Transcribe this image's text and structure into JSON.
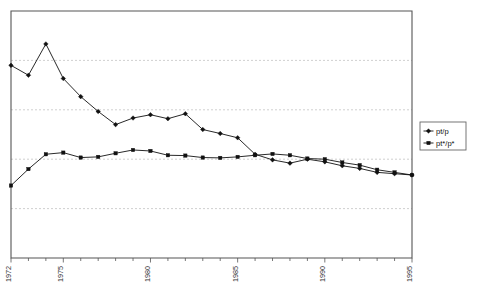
{
  "chart_data": {
    "type": "line",
    "title": "",
    "subtitle": "",
    "xlabel": "",
    "ylabel": "",
    "grid": true,
    "gridlines_y": [
      0.9,
      0.75,
      0.6,
      0.45
    ],
    "xlim": [
      1972,
      1995
    ],
    "ylim": [
      0.3,
      1.05
    ],
    "legend_position": "right",
    "x": [
      1972,
      1973,
      1974,
      1975,
      1976,
      1977,
      1978,
      1979,
      1980,
      1981,
      1982,
      1983,
      1984,
      1985,
      1986,
      1987,
      1988,
      1989,
      1990,
      1991,
      1992,
      1993,
      1994,
      1995
    ],
    "xtick_labels": [
      "1972",
      "1975",
      "1980",
      "1985",
      "1990",
      "1995"
    ],
    "xtick_values": [
      1972,
      1975,
      1980,
      1985,
      1990,
      1995
    ],
    "series": [
      {
        "name": "pt/p",
        "marker": "diamond",
        "color": "#111111",
        "values": [
          0.885,
          0.855,
          0.95,
          0.845,
          0.79,
          0.745,
          0.705,
          0.725,
          0.735,
          0.723,
          0.738,
          0.69,
          0.678,
          0.665,
          0.615,
          0.598,
          0.588,
          0.6,
          0.592,
          0.58,
          0.572,
          0.56,
          0.556,
          0.552
        ]
      },
      {
        "name": "pt*/p*",
        "marker": "square",
        "color": "#111111",
        "values": [
          0.52,
          0.57,
          0.615,
          0.62,
          0.605,
          0.607,
          0.618,
          0.628,
          0.625,
          0.612,
          0.611,
          0.605,
          0.604,
          0.607,
          0.612,
          0.616,
          0.612,
          0.602,
          0.6,
          0.59,
          0.582,
          0.568,
          0.56,
          0.552
        ]
      }
    ]
  },
  "legend": {
    "entries": [
      {
        "label": "pt/p",
        "marker": "diamond"
      },
      {
        "label": "pt*/p*",
        "marker": "square"
      }
    ]
  }
}
